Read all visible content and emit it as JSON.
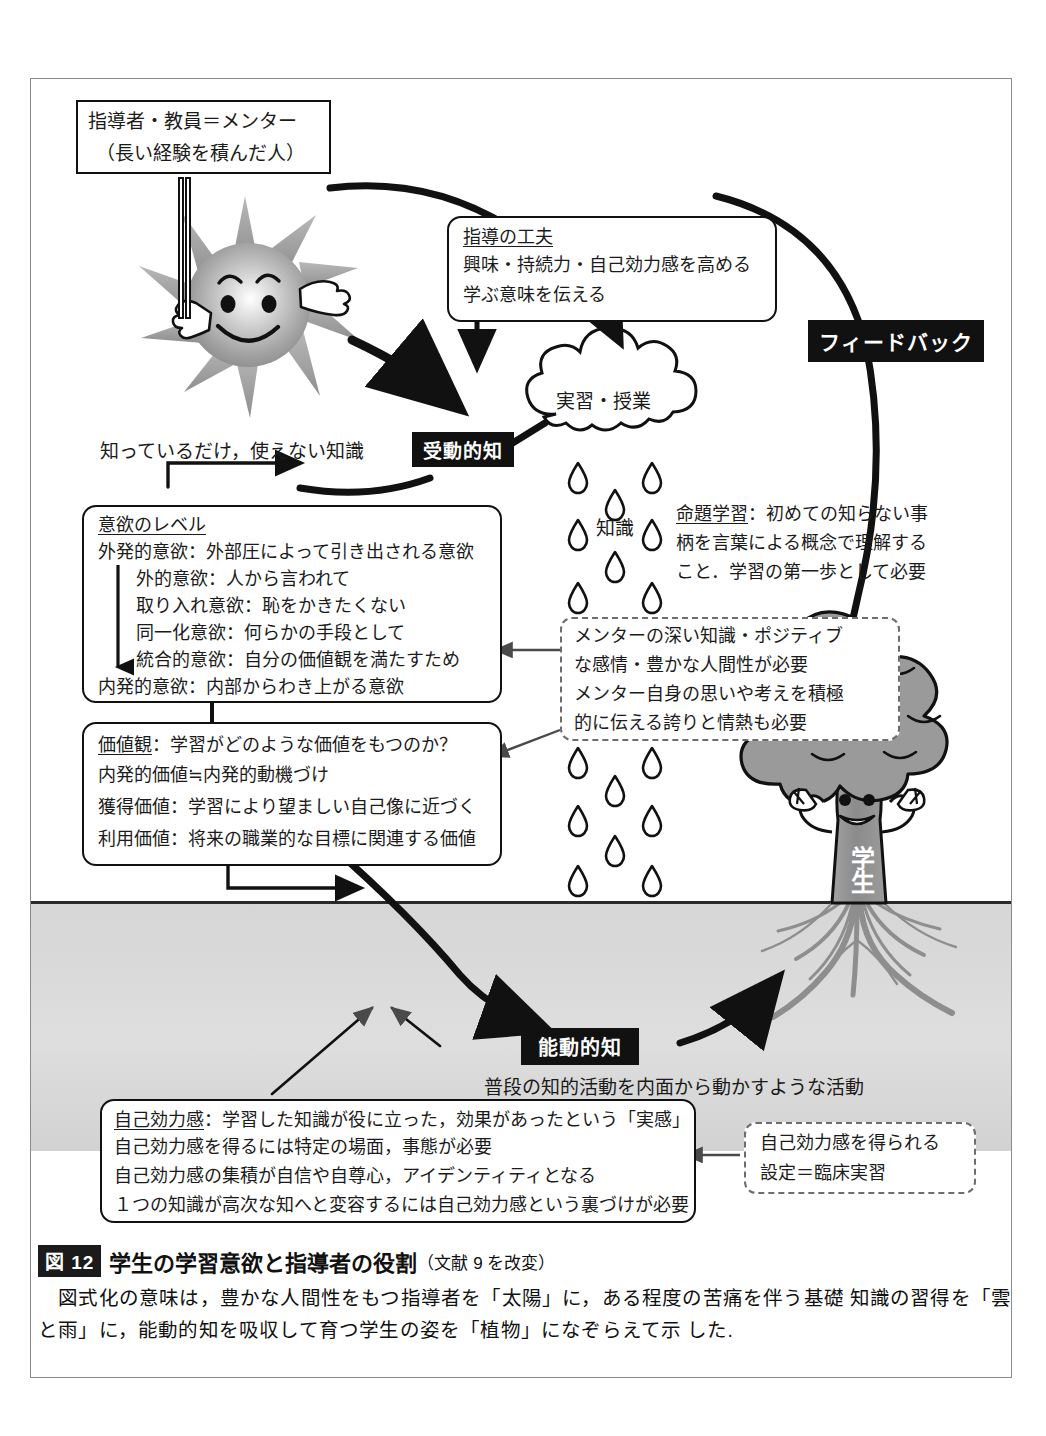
{
  "figure": {
    "number_label": "図 12",
    "title": "学生の学習意欲と指導者の役割",
    "source": "（文献 9 を改変）",
    "body": "　図式化の意味は，豊かな人間性をもつ指導者を「太陽」に，ある程度の苦痛を伴う基礎\n知識の習得を「雲と雨」に，能動的知を吸収して育つ学生の姿を「植物」になぞらえて示\nした."
  },
  "nodes": {
    "mentor_sign": {
      "line1": "指導者・教員＝メンター",
      "line2": "（長い経験を積んだ人）"
    },
    "teaching_methods": {
      "heading": "指導の工夫",
      "line1": "興味・持続力・自己効力感を高める",
      "line2": "学ぶ意味を伝える"
    },
    "cloud": {
      "label": "実習・授業"
    },
    "rain": {
      "label": "知識"
    },
    "feedback_badge": {
      "label": "フィードバック"
    },
    "passive_badge": {
      "label": "受動的知"
    },
    "passive_note": {
      "label": "知っているだけ，使えない知識"
    },
    "active_badge": {
      "label": "能動的知"
    },
    "active_note": {
      "label": "普段の知的活動を内面から動かすような活動"
    },
    "propositional_learning": {
      "heading": "命題学習",
      "line1": "：初めての知らない事",
      "line2": "柄を言葉による概念で理解する",
      "line3": "こと．学習の第一歩として必要"
    },
    "motivation_levels": {
      "heading": "意欲のレベル",
      "line1": "外発的意欲：外部圧によって引き出される意欲",
      "line2": "外的意欲：人から言われて",
      "line3": "取り入れ意欲：恥をかきたくない",
      "line4": "同一化意欲：何らかの手段として",
      "line5": "統合的意欲：自分の価値観を満たすため",
      "line6": "内発的意欲：内部からわき上がる意欲"
    },
    "values": {
      "heading": "価値観",
      "line1": "：学習がどのような価値をもつのか？",
      "line2": "内発的価値≒内発的動機づけ",
      "line3": "獲得価値：学習により望ましい自己像に近づく",
      "line4": "利用価値：将来の職業的な目標に関連する価値"
    },
    "mentor_requirements": {
      "line1": "メンターの深い知識・ポジティブ",
      "line2": "な感情・豊かな人間性が必要",
      "line3": "メンター自身の思いや考えを積極",
      "line4": "的に伝える誇りと情熱も必要"
    },
    "self_efficacy": {
      "heading": "自己効力感",
      "line1": "：学習した知識が役に立った，効果があったという「実感」",
      "line2": "自己効力感を得るには特定の場面，事態が必要",
      "line3": "自己効力感の集積が自信や自尊心，アイデンティティとなる",
      "line4": "１つの知識が高次な知へと変容するには自己効力感という裏づけが必要"
    },
    "clinical_setting": {
      "line1": "自己効力感を得られる",
      "line2": "設定＝臨床実習"
    },
    "tree": {
      "label": "学生"
    }
  },
  "colors": {
    "ink": "#111111",
    "ground": "#d8d8d8",
    "tree_foliage": "#9a9a9a",
    "tree_trunk": "#8c8c8c",
    "sun": "#9e9e9e",
    "badge_bg": "#111111",
    "badge_text": "#ffffff"
  }
}
